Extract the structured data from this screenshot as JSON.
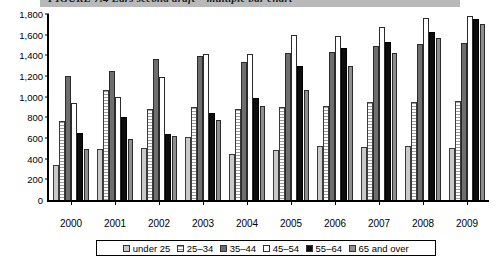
{
  "caption": {
    "text": "FIGURE 7.4    Ears second draft – multiple bar chart"
  },
  "chart_data": {
    "type": "bar",
    "title": "FIGURE 7.4    Ears second draft – multiple bar chart",
    "xlabel": "",
    "ylabel": "",
    "ylim": [
      0,
      1800
    ],
    "ytick_labels": [
      "1,800",
      "1,600",
      "1,400",
      "1,200",
      "1,000",
      "800",
      "600",
      "400",
      "200",
      "0"
    ],
    "ytick_values": [
      1800,
      1600,
      1400,
      1200,
      1000,
      800,
      600,
      400,
      200,
      0
    ],
    "grid": false,
    "legend_position": "bottom",
    "categories": [
      "2000",
      "2001",
      "2002",
      "2003",
      "2004",
      "2005",
      "2006",
      "2007",
      "2008",
      "2009"
    ],
    "series": [
      {
        "name": "under 25",
        "color": "#c9c9c9",
        "values": [
          340,
          490,
          500,
          610,
          450,
          480,
          520,
          510,
          520,
          500
        ]
      },
      {
        "name": "25–34",
        "color": "#ffffff",
        "values": [
          760,
          1060,
          880,
          900,
          880,
          900,
          910,
          950,
          950,
          960
        ]
      },
      {
        "name": "35–44",
        "color": "#6e6e6e",
        "values": [
          1200,
          1250,
          1360,
          1390,
          1340,
          1420,
          1430,
          1490,
          1510,
          1520
        ]
      },
      {
        "name": "45–54",
        "color": "#ffffff",
        "values": [
          940,
          1000,
          1190,
          1410,
          1410,
          1600,
          1590,
          1670,
          1760,
          1780
        ]
      },
      {
        "name": "55–64",
        "color": "#0d0d0d",
        "values": [
          650,
          800,
          640,
          840,
          990,
          1300,
          1470,
          1530,
          1630,
          1750
        ]
      },
      {
        "name": "65 and over",
        "color": "#8f8f8f",
        "values": [
          490,
          590,
          620,
          770,
          910,
          1060,
          1300,
          1420,
          1570,
          1700
        ]
      }
    ]
  }
}
